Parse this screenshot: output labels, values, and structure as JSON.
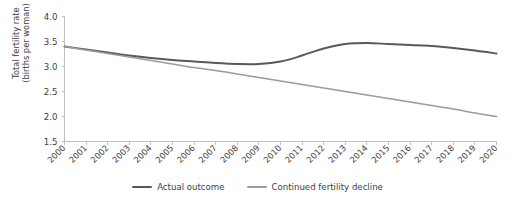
{
  "chart_data": {
    "type": "line",
    "title": "",
    "xlabel": "",
    "ylabel": "Total fertility rate (births per woman)",
    "ylabel_line1": "Total fertility rate",
    "ylabel_line2": "(births per woman)",
    "grid": false,
    "legend_position": "bottom-center",
    "ylim": [
      1.5,
      4.0
    ],
    "ytick_labels": [
      "4.0",
      "3.5",
      "3.0",
      "2.5",
      "2.0",
      "1.5"
    ],
    "ytick_values": [
      4.0,
      3.5,
      3.0,
      2.5,
      2.0,
      1.5
    ],
    "categories": [
      "2000",
      "2001",
      "2002",
      "2003",
      "2004",
      "2005",
      "2006",
      "2007",
      "2008",
      "2009",
      "2010",
      "2011",
      "2012",
      "2013",
      "2014",
      "2015",
      "2016",
      "2017",
      "2018",
      "2019",
      "2020"
    ],
    "x": [
      2000,
      2001,
      2002,
      2003,
      2004,
      2005,
      2006,
      2007,
      2008,
      2009,
      2010,
      2011,
      2012,
      2013,
      2014,
      2015,
      2016,
      2017,
      2018,
      2019,
      2020
    ],
    "series": [
      {
        "name": "Actual outcome",
        "color": "#595959",
        "values": [
          3.4,
          3.34,
          3.28,
          3.22,
          3.17,
          3.13,
          3.1,
          3.07,
          3.05,
          3.05,
          3.1,
          3.22,
          3.36,
          3.45,
          3.47,
          3.45,
          3.43,
          3.41,
          3.37,
          3.32,
          3.26
        ]
      },
      {
        "name": "Continued fertility decline",
        "color": "#9b9b9b",
        "values": [
          3.4,
          3.33,
          3.26,
          3.19,
          3.12,
          3.05,
          2.98,
          2.92,
          2.85,
          2.78,
          2.71,
          2.64,
          2.57,
          2.5,
          2.43,
          2.36,
          2.29,
          2.22,
          2.15,
          2.07,
          2.0
        ]
      }
    ]
  },
  "legend": {
    "items": [
      {
        "label": "Actual outcome",
        "color": "#595959"
      },
      {
        "label": "Continued fertility decline",
        "color": "#9b9b9b"
      }
    ]
  }
}
